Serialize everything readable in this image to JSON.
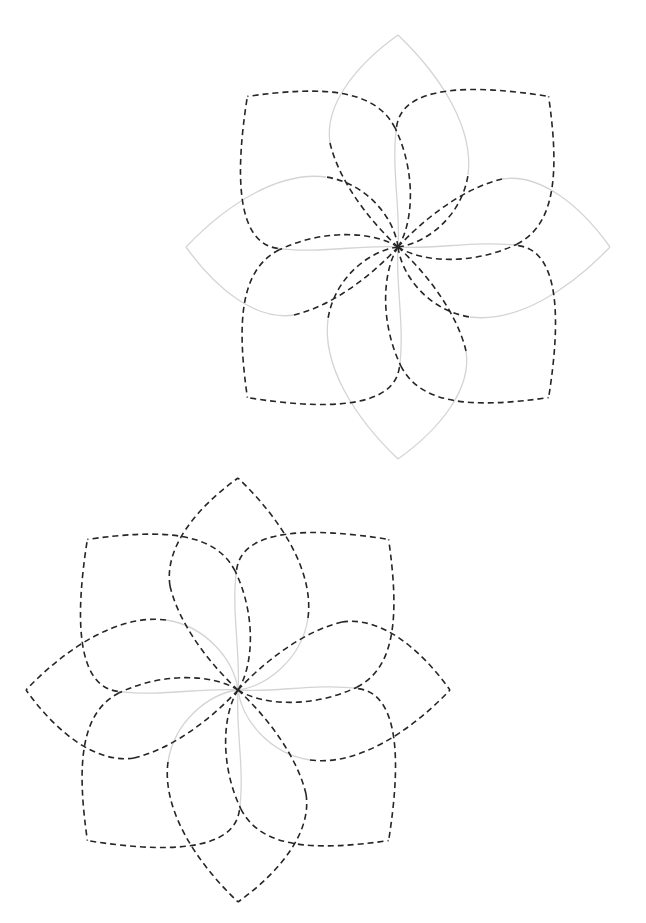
{
  "canvas": {
    "width": 646,
    "height": 923,
    "background": "#ffffff"
  },
  "styles": {
    "dashed_color": "#262626",
    "gray_color": "#d4d4d4"
  },
  "shapes": {
    "pointed": {
      "tip_distance": 212,
      "sideA_inner": "M0,0 C30,-4 64,-32 70,-72",
      "sideA_outer": "M70,-72 C76,-118 44,-170 0,-212",
      "sideB_inner": "M0,0 C-24,-22 -58,-62 -68,-104",
      "sideB_outer": "M-68,-104 C-74,-142 -42,-182 0,-212"
    },
    "square": {
      "tip_distance": 213,
      "sideA_inner": "M0,0 C28,-6 66,-40 82,-86",
      "sideA_outer": "M82,-86 C96,-128 60,-168 0,-213",
      "sideB_inner": "M0,0 C-22,-26 -62,-52 -86,-84",
      "sideB_outer": "M-86,-84 C-112,-118 -62,-168 0,-213"
    }
  },
  "flowers": [
    {
      "name": "flower-top",
      "center": [
        398,
        247
      ],
      "petals": [
        {
          "angle": 0,
          "shape": "pointed",
          "A_in": "dashed",
          "A_out": "gray",
          "B_in": "dashed",
          "B_out": "gray"
        },
        {
          "angle": 45,
          "shape": "square",
          "A_in": "dashed",
          "A_out": "dashed",
          "B_in": "gray",
          "B_out": "dashed"
        },
        {
          "angle": 90,
          "shape": "pointed",
          "A_in": "dashed",
          "A_out": "gray",
          "B_in": "dashed",
          "B_out": "gray"
        },
        {
          "angle": 135,
          "shape": "square",
          "A_in": "dashed",
          "A_out": "dashed",
          "B_in": "gray",
          "B_out": "dashed"
        },
        {
          "angle": 180,
          "shape": "pointed",
          "A_in": "dashed",
          "A_out": "gray",
          "B_in": "dashed",
          "B_out": "gray"
        },
        {
          "angle": 225,
          "shape": "square",
          "A_in": "dashed",
          "A_out": "dashed",
          "B_in": "gray",
          "B_out": "dashed"
        },
        {
          "angle": 270,
          "shape": "pointed",
          "A_in": "dashed",
          "A_out": "gray",
          "B_in": "dashed",
          "B_out": "gray"
        },
        {
          "angle": 315,
          "shape": "square",
          "A_in": "dashed",
          "A_out": "dashed",
          "B_in": "gray",
          "B_out": "dashed"
        }
      ]
    },
    {
      "name": "flower-bottom",
      "center": [
        238,
        690
      ],
      "petals": [
        {
          "angle": 0,
          "shape": "pointed",
          "A_in": "gray",
          "A_out": "dashed",
          "B_in": "dashed",
          "B_out": "dashed"
        },
        {
          "angle": 45,
          "shape": "square",
          "A_in": "dashed",
          "A_out": "dashed",
          "B_in": "gray",
          "B_out": "dashed"
        },
        {
          "angle": 90,
          "shape": "pointed",
          "A_in": "gray",
          "A_out": "dashed",
          "B_in": "dashed",
          "B_out": "dashed"
        },
        {
          "angle": 135,
          "shape": "square",
          "A_in": "dashed",
          "A_out": "dashed",
          "B_in": "gray",
          "B_out": "dashed"
        },
        {
          "angle": 180,
          "shape": "pointed",
          "A_in": "gray",
          "A_out": "dashed",
          "B_in": "dashed",
          "B_out": "dashed"
        },
        {
          "angle": 225,
          "shape": "square",
          "A_in": "dashed",
          "A_out": "dashed",
          "B_in": "gray",
          "B_out": "dashed"
        },
        {
          "angle": 270,
          "shape": "pointed",
          "A_in": "gray",
          "A_out": "dashed",
          "B_in": "dashed",
          "B_out": "dashed"
        },
        {
          "angle": 315,
          "shape": "square",
          "A_in": "dashed",
          "A_out": "dashed",
          "B_in": "gray",
          "B_out": "dashed"
        }
      ]
    }
  ]
}
